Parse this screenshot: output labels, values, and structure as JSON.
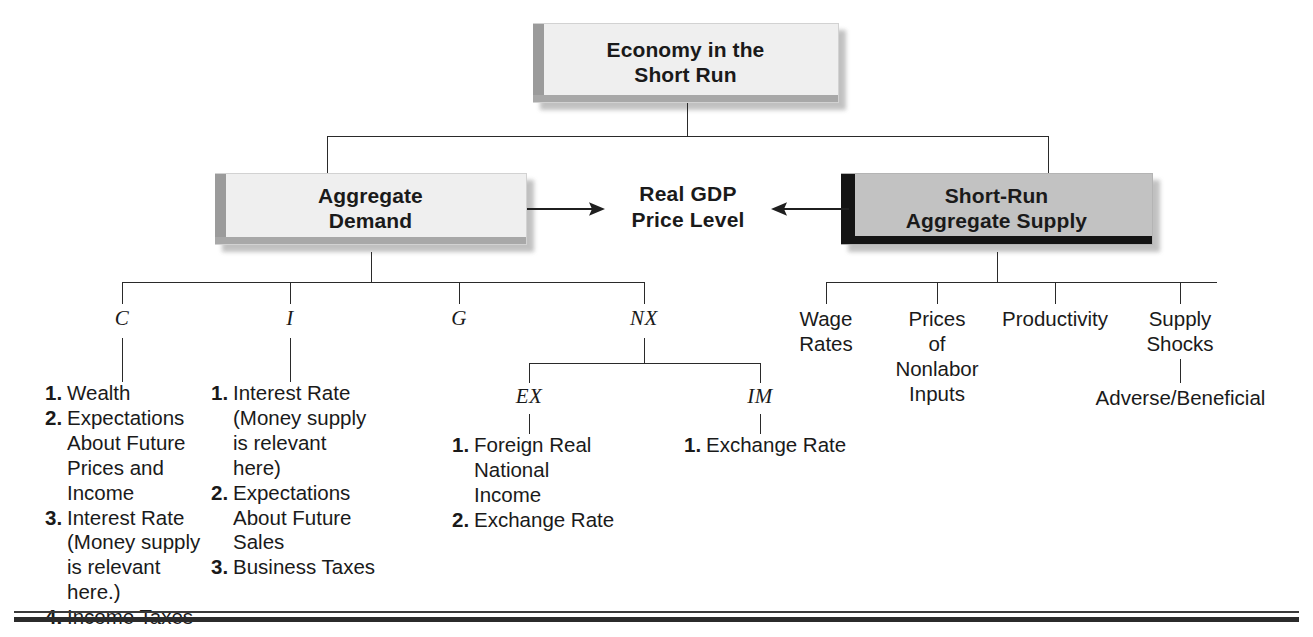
{
  "diagram": {
    "title": "Economy in the Short Run",
    "root_box": {
      "label": "Economy in the\nShort Run",
      "line1": "Economy in the",
      "line2": "Short Run"
    },
    "center_outcome": {
      "line1": "Real GDP",
      "line2": "Price Level"
    },
    "demand_box": {
      "line1": "Aggregate",
      "line2": "Demand"
    },
    "supply_box": {
      "line1": "Short-Run",
      "line2": "Aggregate Supply"
    },
    "components": [
      {
        "symbol": "C",
        "name": "consumption"
      },
      {
        "symbol": "I",
        "name": "investment"
      },
      {
        "symbol": "G",
        "name": "government-purchases"
      },
      {
        "symbol": "NX",
        "name": "net-exports"
      }
    ],
    "nx_children": [
      {
        "symbol": "EX",
        "name": "exports"
      },
      {
        "symbol": "IM",
        "name": "imports"
      }
    ],
    "c_factors": [
      {
        "num": "1.",
        "text": "Wealth"
      },
      {
        "num": "2.",
        "text": "Expectations About Future Prices and Income"
      },
      {
        "num": "3.",
        "text": "Interest Rate (Money supply is relevant here.)"
      },
      {
        "num": "4.",
        "text": "Income Taxes"
      }
    ],
    "i_factors": [
      {
        "num": "1.",
        "text": "Interest Rate (Money supply is relevant here)"
      },
      {
        "num": "2.",
        "text": "Expectations About Future Sales"
      },
      {
        "num": "3.",
        "text": "Business Taxes"
      }
    ],
    "ex_factors": [
      {
        "num": "1.",
        "text": "Foreign Real National Income"
      },
      {
        "num": "2.",
        "text": "Exchange Rate"
      }
    ],
    "im_factors": [
      {
        "num": "1.",
        "text": "Exchange Rate"
      }
    ],
    "supply_factors": [
      {
        "line1": "Wage",
        "line2": "Rates",
        "line3": "",
        "line4": ""
      },
      {
        "line1": "Prices",
        "line2": "of",
        "line3": "Nonlabor",
        "line4": "Inputs"
      },
      {
        "line1": "Productivity",
        "line2": "",
        "line3": "",
        "line4": ""
      },
      {
        "line1": "Supply",
        "line2": "Shocks",
        "line3": "",
        "line4": ""
      }
    ],
    "supply_shock_sub": "Adverse/Beneficial",
    "colors": {
      "line": "#2a2a2a",
      "box_light_fill": "#efefef",
      "box_light_edge": "#9b9b9b",
      "box_dark_fill": "#c2c2c2",
      "box_dark_edge": "#141414",
      "text": "#1a1a1a",
      "rule": "#2b2b2b"
    }
  }
}
